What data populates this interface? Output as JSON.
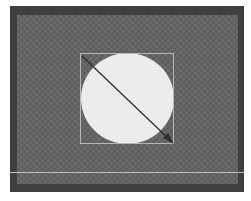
{
  "canvas": {
    "frame_color": "#3f3f3f",
    "checker_light": "#6a6a6a",
    "checker_dark": "#5e5e5e"
  },
  "shape": {
    "type": "circle",
    "fill": "#ececec",
    "bbox_color": "#b8b8b8"
  },
  "arrow": {
    "icon": "resize-arrow-icon",
    "color": "#2e2e2e",
    "from": [
      82,
      56
    ],
    "to": [
      173,
      143
    ]
  },
  "guide_line": {
    "color": "#bdbdbd"
  },
  "caption": {
    "text": ""
  }
}
